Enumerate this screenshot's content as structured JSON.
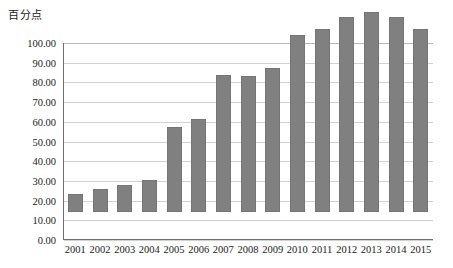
{
  "chart_data": {
    "type": "bar",
    "title": "",
    "ylabel": "百分点",
    "xlabel": "年份",
    "categories": [
      "2001",
      "2002",
      "2003",
      "2004",
      "2005",
      "2006",
      "2007",
      "2008",
      "2009",
      "2010",
      "2011",
      "2012",
      "2013",
      "2014",
      "2015"
    ],
    "values": [
      9.0,
      11.5,
      13.5,
      16.0,
      43.0,
      47.0,
      69.5,
      69.0,
      73.0,
      90.0,
      93.0,
      99.0,
      101.5,
      99.0,
      93.0
    ],
    "ylim": [
      0,
      100
    ],
    "ytick_labels": [
      "100.00",
      "90.00",
      "80.00",
      "70.00",
      "60.00",
      "50.00",
      "40.00",
      "30.00",
      "20.00",
      "10.00",
      "0.00"
    ],
    "ytick_values": [
      100,
      90,
      80,
      70,
      60,
      50,
      40,
      30,
      20,
      10,
      0
    ],
    "grid": true,
    "legend": "none",
    "bar_color": "#808080",
    "grid_color": "#d2d2d2",
    "axis_color": "#6e6e6e"
  }
}
